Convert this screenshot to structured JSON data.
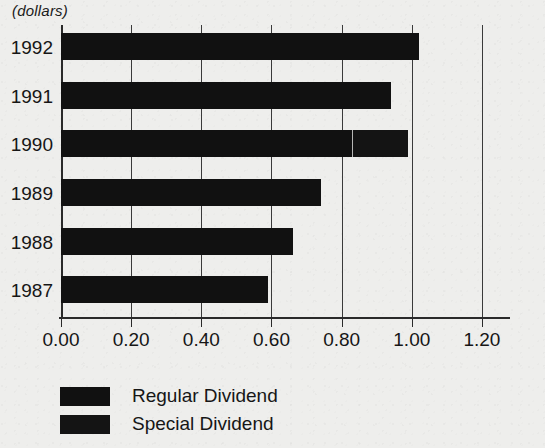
{
  "units_label": "(dollars)",
  "chart_data": {
    "type": "bar",
    "orientation": "horizontal",
    "stacked": true,
    "title": "",
    "subtitle": "",
    "xlabel": "",
    "ylabel": "",
    "units": "(dollars)",
    "categories": [
      "1992",
      "1991",
      "1990",
      "1989",
      "1988",
      "1987"
    ],
    "series": [
      {
        "name": "Regular Dividend",
        "color": "#111111",
        "values": [
          1.02,
          0.94,
          0.83,
          0.74,
          0.66,
          0.59
        ]
      },
      {
        "name": "Special Dividend",
        "color": "#141414",
        "values": [
          0.0,
          0.0,
          0.16,
          0.0,
          0.0,
          0.0
        ]
      }
    ],
    "totals": [
      1.02,
      0.94,
      0.99,
      0.74,
      0.66,
      0.59
    ],
    "xlim": [
      0.0,
      1.28
    ],
    "xticks": [
      0.0,
      0.2,
      0.4,
      0.6,
      0.8,
      1.0,
      1.2
    ],
    "xtick_labels": [
      "0.00",
      "0.20",
      "0.40",
      "0.60",
      "0.80",
      "1.00",
      "1.20"
    ],
    "grid": true,
    "grid_axis": "x",
    "legend_position": "bottom-left",
    "legend": [
      "Regular Dividend",
      "Special Dividend"
    ]
  },
  "legend": {
    "items": [
      {
        "label": "Regular Dividend",
        "swatch": "#111111"
      },
      {
        "label": "Special Dividend",
        "swatch": "#141414"
      }
    ]
  }
}
